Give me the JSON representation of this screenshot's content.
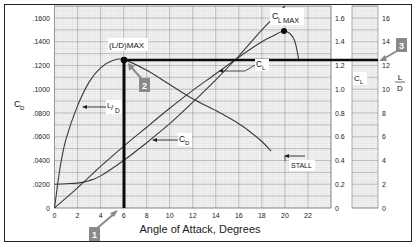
{
  "chart_data": {
    "type": "line",
    "title": "",
    "xlabel": "Angle of Attack, Degrees",
    "x_ticks": [
      "0",
      "2",
      "4",
      "6",
      "8",
      "10",
      "12",
      "14",
      "16",
      "18",
      "20",
      "22"
    ],
    "xlim": [
      0,
      24
    ],
    "axes": {
      "left": {
        "label": "C_D",
        "ticks": [
          "0",
          ".0200",
          ".0400",
          ".0600",
          ".0800",
          ".1000",
          ".1200",
          ".1400",
          ".1600"
        ],
        "ylim": [
          0,
          0.17
        ]
      },
      "right_cl": {
        "label": "C_L",
        "ticks": [
          "0",
          "0.2",
          "0.4",
          "0.6",
          "0.8",
          "1.0",
          "1.2",
          "1.4",
          "1.6"
        ],
        "ylim": [
          0,
          1.7
        ]
      },
      "right_ld": {
        "label": "L/D",
        "ticks": [
          "0",
          "2",
          "4",
          "6",
          "8",
          "10",
          "12",
          "14",
          "16"
        ],
        "ylim": [
          0,
          17
        ]
      }
    },
    "series": [
      {
        "name": "C_L",
        "axis": "right_cl",
        "x": [
          0,
          2,
          4,
          6,
          8,
          10,
          12,
          14,
          16,
          18,
          19,
          20,
          20.8,
          21.2
        ],
        "values": [
          0.0,
          0.17,
          0.35,
          0.52,
          0.68,
          0.84,
          0.99,
          1.13,
          1.27,
          1.4,
          1.45,
          1.49,
          1.42,
          1.25
        ]
      },
      {
        "name": "C_D",
        "axis": "left",
        "x": [
          0,
          1,
          2,
          3,
          4,
          6,
          8,
          10,
          12,
          14,
          16,
          18,
          20
        ],
        "values": [
          0.02,
          0.0205,
          0.021,
          0.023,
          0.027,
          0.04,
          0.055,
          0.071,
          0.089,
          0.108,
          0.128,
          0.15,
          0.172
        ]
      },
      {
        "name": "L/D",
        "axis": "right_ld",
        "x": [
          0,
          0.5,
          1,
          2,
          3,
          4,
          5,
          6,
          8,
          10,
          12,
          14,
          16,
          17,
          18,
          18.8
        ],
        "values": [
          0.0,
          3.5,
          5.8,
          8.6,
          10.6,
          11.8,
          12.4,
          12.5,
          11.6,
          10.4,
          9.2,
          8.2,
          7.1,
          6.4,
          5.6,
          4.8
        ]
      }
    ],
    "annotations": [
      {
        "text": "(L/D)MAX",
        "x": 6,
        "value": 12.5
      },
      {
        "text": "C_LMAX",
        "x": 20,
        "value": 1.49
      },
      {
        "text": "STALL",
        "x": 20,
        "value": 0.4
      },
      {
        "text": "1",
        "kind": "callout",
        "points_to": "alpha = 6"
      },
      {
        "text": "2",
        "kind": "callout",
        "points_to": "(L/D)max point"
      },
      {
        "text": "3",
        "kind": "callout",
        "points_to": "L/D = 12.5 reference line"
      }
    ],
    "reference_lines": [
      {
        "orientation": "vertical",
        "x": 6
      },
      {
        "orientation": "horizontal",
        "axis": "right_ld",
        "value": 12.5
      }
    ],
    "grid": true,
    "legend": "none (inline labels)"
  },
  "labels": {
    "x_title": "Angle of Attack, Degrees",
    "cd_axis": "C",
    "cd_sub": "D",
    "cl_axis": "C",
    "cl_sub": "L",
    "ld_num": "L",
    "ld_den": "D",
    "ld_max": "(L/D)MAX",
    "cl_max": "MAX",
    "curve_ld": "L/D",
    "curve_cd": "D",
    "curve_cl": "L",
    "stall": "STALL",
    "callout1": "1",
    "callout2": "2",
    "callout3": "3"
  },
  "colors": {
    "curve": "#3a3a3a",
    "grid_minor": "#bdbdbd",
    "grid_major": "#8c8c8c",
    "heavy_line": "#0a0a0a",
    "callout": "#8a8a8a"
  }
}
